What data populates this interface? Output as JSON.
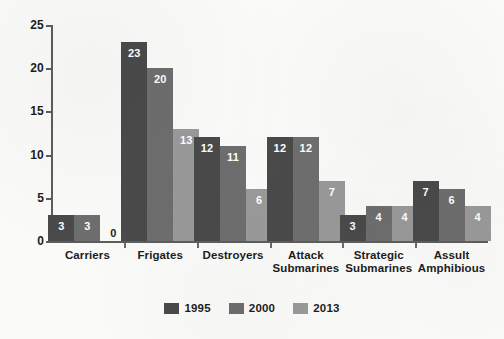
{
  "chart_data": {
    "type": "bar",
    "title": "",
    "subtitle": "",
    "xlabel": "",
    "ylabel": "",
    "ylim": [
      0,
      25
    ],
    "yticks": [
      0,
      5,
      10,
      15,
      20,
      25
    ],
    "grid": false,
    "legend_position": "bottom-center",
    "categories": [
      "Carriers",
      "Frigates",
      "Destroyers",
      "Attack\nSubmarines",
      "Strategic\nSubmarines",
      "Assult\nAmphibious"
    ],
    "series": [
      {
        "name": "1995",
        "color": "#4a4a4a",
        "values": [
          3,
          23,
          12,
          12,
          3,
          7
        ]
      },
      {
        "name": "2000",
        "color": "#6e6e6e",
        "values": [
          3,
          20,
          11,
          12,
          4,
          6
        ]
      },
      {
        "name": "2013",
        "color": "#9a9a9a",
        "values": [
          0,
          13,
          6,
          7,
          4,
          4
        ]
      }
    ]
  },
  "axis": {
    "y_tick_labels": [
      "0",
      "5",
      "10",
      "15",
      "20",
      "25"
    ]
  },
  "legend": {
    "items": [
      {
        "label": "1995"
      },
      {
        "label": "2000"
      },
      {
        "label": "2013"
      }
    ]
  }
}
